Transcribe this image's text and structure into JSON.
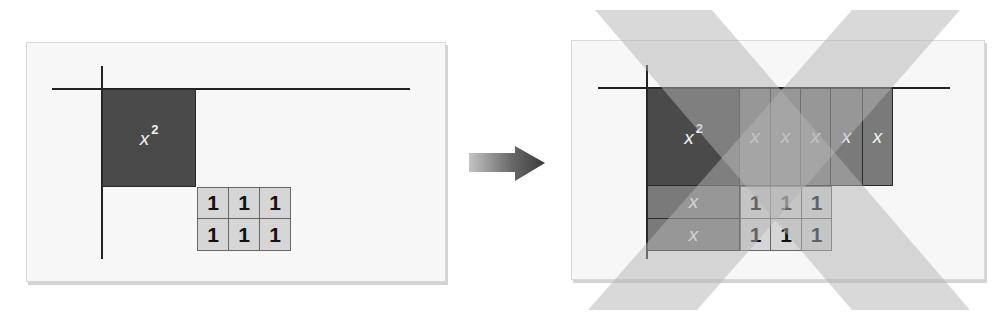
{
  "diagram": {
    "title": "",
    "left_panel": {
      "description": "Initial algebra tiles before completing the rectangle",
      "x_squared_tile": {
        "label": "x",
        "exponent": "2"
      },
      "unit_tiles": {
        "rows": 2,
        "cols": 3,
        "labels": [
          [
            "1",
            "1",
            "1"
          ],
          [
            "1",
            "1",
            "1"
          ]
        ]
      }
    },
    "arrow": {
      "icon": "right-arrow-icon",
      "direction": "right"
    },
    "right_panel": {
      "description": "Attempted rectangle arrangement crossed out with a large X",
      "x_squared_tile": {
        "label": "x",
        "exponent": "2"
      },
      "x_tiles_right": [
        "x",
        "x",
        "x",
        "x",
        "x"
      ],
      "x_tiles_below": [
        "x",
        "x"
      ],
      "unit_tiles": {
        "rows": 2,
        "cols": 3,
        "labels": [
          [
            "1",
            "1",
            "1"
          ],
          [
            "1",
            "1",
            "1"
          ]
        ]
      },
      "overlay": {
        "icon": "cross-out-x-icon",
        "meaning": "incorrect arrangement"
      }
    },
    "colors": {
      "x_squared_tile": "#4a4a4a",
      "x_tile": "#7a7a7a",
      "unit_tile": "#d6d6d6",
      "axis": "#222222",
      "cross_out": "#c8c8c8",
      "panel_bg": "#f7f7f7"
    }
  }
}
